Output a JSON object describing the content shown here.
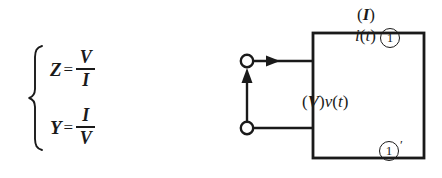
{
  "figure": {
    "background_color": "#ffffff",
    "ink_color": "#1a1a1a"
  },
  "equations": {
    "brace": "{",
    "items": [
      {
        "lhs": "Z",
        "operator": "=",
        "numerator": "V",
        "denominator": "I",
        "reading": "Z = V / I"
      },
      {
        "lhs": "Y",
        "operator": "=",
        "numerator": "I",
        "denominator": "V",
        "reading": "Y = I / V"
      }
    ]
  },
  "circuit": {
    "current_label": {
      "phasor_open": "(",
      "phasor_symbol": "I",
      "phasor_close": ")",
      "time_symbol": "i",
      "time_open": "(",
      "time_arg": "t",
      "time_close": ")"
    },
    "voltage_label": {
      "phasor_open": "(",
      "phasor_symbol": "V",
      "phasor_close": ")",
      "time_symbol": "v",
      "time_open": "(",
      "time_arg": "t",
      "time_close": ")"
    },
    "terminals": [
      {
        "name": "top",
        "label": "1",
        "prime": ""
      },
      {
        "name": "bottom",
        "label": "1",
        "prime": "′"
      }
    ],
    "network_box": {
      "label": "",
      "x": 163,
      "y": 33,
      "width": 111,
      "height": 125
    }
  }
}
